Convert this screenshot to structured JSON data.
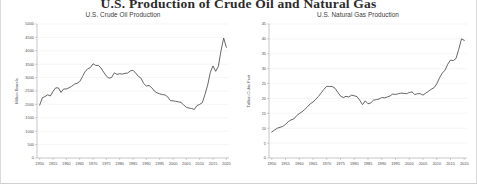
{
  "header": {
    "main_title": "U.S. Production of Crude Oil and Natural Gas"
  },
  "charts": {
    "left": {
      "title": "U.S. Crude Oil Production",
      "ylabel": "Million Barrels",
      "xlabel": ""
    },
    "right": {
      "title": "U.S. Natural Gas Production",
      "ylabel": "Trillion Cubic Feet",
      "xlabel": ""
    }
  },
  "chart_data": [
    {
      "type": "line",
      "id": "crude-oil",
      "title": "U.S. Crude Oil Production",
      "xlabel": "",
      "ylabel": "Million Barrels",
      "xlim": [
        1949,
        2021
      ],
      "ylim": [
        0,
        5000
      ],
      "ytick_labels": [
        "0",
        "500",
        "1000",
        "1500",
        "2000",
        "2500",
        "3000",
        "3500",
        "4000",
        "4500",
        "5000"
      ],
      "yticks": [
        0,
        500,
        1000,
        1500,
        2000,
        2500,
        3000,
        3500,
        4000,
        4500,
        5000
      ],
      "xtick_labels": [
        "1950",
        "1955",
        "1960",
        "1965",
        "1970",
        "1975",
        "1980",
        "1985",
        "1990",
        "1995",
        "2000",
        "2005",
        "2010",
        "2015",
        "2020"
      ],
      "xticks": [
        1950,
        1955,
        1960,
        1965,
        1970,
        1975,
        1980,
        1985,
        1990,
        1995,
        2000,
        2005,
        2010,
        2015,
        2020
      ],
      "grid": "horizontal",
      "legend": "none",
      "x": [
        1950,
        1951,
        1952,
        1953,
        1954,
        1955,
        1956,
        1957,
        1958,
        1959,
        1960,
        1961,
        1962,
        1963,
        1964,
        1965,
        1966,
        1967,
        1968,
        1969,
        1970,
        1971,
        1972,
        1973,
        1974,
        1975,
        1976,
        1977,
        1978,
        1979,
        1980,
        1981,
        1982,
        1983,
        1984,
        1985,
        1986,
        1987,
        1988,
        1989,
        1990,
        1991,
        1992,
        1993,
        1994,
        1995,
        1996,
        1997,
        1998,
        1999,
        2000,
        2001,
        2002,
        2003,
        2004,
        2005,
        2006,
        2007,
        2008,
        2009,
        2010,
        2011,
        2012,
        2013,
        2014,
        2015,
        2016,
        2017,
        2018,
        2019,
        2020
      ],
      "y": [
        1974,
        2248,
        2290,
        2357,
        2315,
        2484,
        2617,
        2617,
        2449,
        2575,
        2575,
        2622,
        2676,
        2753,
        2787,
        2849,
        3028,
        3216,
        3329,
        3372,
        3517,
        3454,
        3455,
        3361,
        3203,
        3057,
        2976,
        3009,
        3178,
        3121,
        3146,
        3129,
        3157,
        3171,
        3250,
        3274,
        3168,
        3047,
        2979,
        2779,
        2685,
        2707,
        2625,
        2499,
        2431,
        2394,
        2366,
        2355,
        2282,
        2147,
        2131,
        2118,
        2097,
        2073,
        1983,
        1890,
        1862,
        1848,
        1812,
        1956,
        2001,
        2065,
        2377,
        2720,
        3200,
        3436,
        3235,
        3415,
        4004,
        4477,
        4129
      ],
      "line_color": "#4a4a4a"
    },
    {
      "type": "line",
      "id": "natural-gas",
      "title": "U.S. Natural Gas Production",
      "xlabel": "",
      "ylabel": "Trillion Cubic Feet",
      "xlim": [
        1949,
        2021
      ],
      "ylim": [
        0,
        45
      ],
      "ytick_labels": [
        "0",
        "5",
        "10",
        "15",
        "20",
        "25",
        "30",
        "35",
        "40",
        "45"
      ],
      "yticks": [
        0,
        5,
        10,
        15,
        20,
        25,
        30,
        35,
        40,
        45
      ],
      "xtick_labels": [
        "1950",
        "1955",
        "1960",
        "1965",
        "1970",
        "1975",
        "1980",
        "1985",
        "1990",
        "1995",
        "2000",
        "2005",
        "2010",
        "2015",
        "2020"
      ],
      "xticks": [
        1950,
        1955,
        1960,
        1965,
        1970,
        1975,
        1980,
        1985,
        1990,
        1995,
        2000,
        2005,
        2010,
        2015,
        2020
      ],
      "grid": "horizontal",
      "legend": "none",
      "x": [
        1950,
        1951,
        1952,
        1953,
        1954,
        1955,
        1956,
        1957,
        1958,
        1959,
        1960,
        1961,
        1962,
        1963,
        1964,
        1965,
        1966,
        1967,
        1968,
        1969,
        1970,
        1971,
        1972,
        1973,
        1974,
        1975,
        1976,
        1977,
        1978,
        1979,
        1980,
        1981,
        1982,
        1983,
        1984,
        1985,
        1986,
        1987,
        1988,
        1989,
        1990,
        1991,
        1992,
        1993,
        1994,
        1995,
        1996,
        1997,
        1998,
        1999,
        2000,
        2001,
        2002,
        2003,
        2004,
        2005,
        2006,
        2007,
        2008,
        2009,
        2010,
        2011,
        2012,
        2013,
        2014,
        2015,
        2016,
        2017,
        2018,
        2019,
        2020
      ],
      "y": [
        8.7,
        9.4,
        10.0,
        10.3,
        10.6,
        11.3,
        12.2,
        12.8,
        13.1,
        14.2,
        14.9,
        15.5,
        16.3,
        17.2,
        18.2,
        18.8,
        19.7,
        20.7,
        21.9,
        23.1,
        24.1,
        24.0,
        24.0,
        23.4,
        22.1,
        20.8,
        20.3,
        20.7,
        20.5,
        21.1,
        20.9,
        20.6,
        19.4,
        17.9,
        19.2,
        18.2,
        18.5,
        19.4,
        19.6,
        19.8,
        20.3,
        20.2,
        20.5,
        20.8,
        21.5,
        21.3,
        21.6,
        21.8,
        21.7,
        21.6,
        22.0,
        22.2,
        21.3,
        21.6,
        21.6,
        21.1,
        21.8,
        22.4,
        23.1,
        23.6,
        24.9,
        26.9,
        28.5,
        29.5,
        31.5,
        32.9,
        32.7,
        33.4,
        36.5,
        40.0,
        39.5
      ],
      "line_color": "#4a4a4a"
    }
  ]
}
